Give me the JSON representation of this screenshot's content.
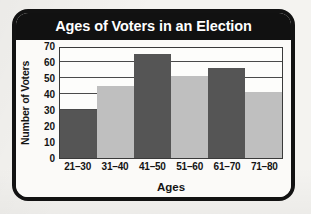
{
  "chart_data": {
    "type": "bar",
    "title": "Ages of Voters in an Election",
    "xlabel": "Ages",
    "ylabel": "Number of Voters",
    "categories": [
      "21–30",
      "31–40",
      "41–50",
      "51–60",
      "61–70",
      "71–80"
    ],
    "values": [
      30,
      45,
      65,
      51,
      56,
      41
    ],
    "bar_colors": [
      "#555555",
      "#bfbfbf",
      "#555555",
      "#bfbfbf",
      "#555555",
      "#bfbfbf"
    ],
    "ylim": [
      0,
      70
    ],
    "ytick_labels": [
      "70",
      "60",
      "50",
      "40",
      "30",
      "20",
      "10",
      "0"
    ],
    "ytick_values": [
      70,
      60,
      50,
      40,
      30,
      20,
      10,
      0
    ],
    "gridlines": true,
    "grid_values": [
      10,
      20,
      30,
      40,
      50,
      60
    ],
    "legend": "none",
    "plot_background": "#fdfdfb",
    "frame_color": "#121212",
    "title_bar_color": "#111111",
    "title_text_color": "#ffffff",
    "page_background": "#f2f1ee"
  }
}
